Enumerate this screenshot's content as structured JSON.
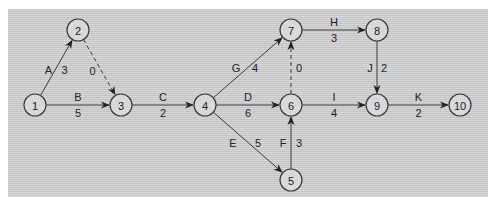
{
  "diagram": {
    "type": "activity-on-arrow network",
    "nodes": [
      {
        "id": "1",
        "label": "1"
      },
      {
        "id": "2",
        "label": "2"
      },
      {
        "id": "3",
        "label": "3"
      },
      {
        "id": "4",
        "label": "4"
      },
      {
        "id": "5",
        "label": "5"
      },
      {
        "id": "6",
        "label": "6"
      },
      {
        "id": "7",
        "label": "7"
      },
      {
        "id": "8",
        "label": "8"
      },
      {
        "id": "9",
        "label": "9"
      },
      {
        "id": "10",
        "label": "10"
      }
    ],
    "activities": [
      {
        "from": "1",
        "to": "2",
        "name": "A",
        "duration": "3",
        "dummy": false
      },
      {
        "from": "1",
        "to": "3",
        "name": "B",
        "duration": "5",
        "dummy": false
      },
      {
        "from": "2",
        "to": "3",
        "name": "",
        "duration": "0",
        "dummy": true
      },
      {
        "from": "3",
        "to": "4",
        "name": "C",
        "duration": "2",
        "dummy": false
      },
      {
        "from": "4",
        "to": "7",
        "name": "G",
        "duration": "4",
        "dummy": false
      },
      {
        "from": "4",
        "to": "6",
        "name": "D",
        "duration": "6",
        "dummy": false
      },
      {
        "from": "4",
        "to": "5",
        "name": "E",
        "duration": "5",
        "dummy": false
      },
      {
        "from": "5",
        "to": "6",
        "name": "F",
        "duration": "3",
        "dummy": false
      },
      {
        "from": "6",
        "to": "7",
        "name": "",
        "duration": "0",
        "dummy": true
      },
      {
        "from": "7",
        "to": "8",
        "name": "H",
        "duration": "3",
        "dummy": false
      },
      {
        "from": "6",
        "to": "9",
        "name": "I",
        "duration": "4",
        "dummy": false
      },
      {
        "from": "8",
        "to": "9",
        "name": "J",
        "duration": "2",
        "dummy": false
      },
      {
        "from": "9",
        "to": "10",
        "name": "K",
        "duration": "2",
        "dummy": false
      }
    ]
  }
}
